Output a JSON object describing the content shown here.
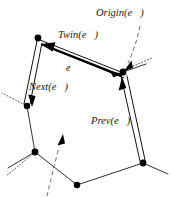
{
  "figure": {
    "background_color": "#ffffff",
    "ink_color": "#000000",
    "width": 172,
    "height": 197
  },
  "labels": {
    "origin": {
      "prefix": "Origin(",
      "symbol": "e",
      "suffix": ")",
      "full": "Origin(e⃗)",
      "x": 96,
      "y": 16
    },
    "twin": {
      "prefix": "Twin(",
      "symbol": "e",
      "suffix": ")",
      "full": "Twin(e⃗)",
      "x": 58,
      "y": 38
    },
    "edge": {
      "prefix": "",
      "symbol": "e",
      "suffix": "",
      "full": "e⃗",
      "x": 66,
      "y": 71
    },
    "next": {
      "prefix": "Next(",
      "symbol": "e",
      "suffix": ")",
      "full": "Next(e⃗)",
      "x": 29,
      "y": 90
    },
    "prev": {
      "prefix": "Prev(",
      "symbol": "e",
      "suffix": ")",
      "full": "Prev(e⃗)",
      "x": 91,
      "y": 124
    }
  },
  "vertices": [
    {
      "name": "top-left",
      "x": 38,
      "y": 38
    },
    {
      "name": "right",
      "x": 123,
      "y": 72
    },
    {
      "name": "left-middle",
      "x": 27,
      "y": 106
    },
    {
      "name": "lower-left",
      "x": 35,
      "y": 152
    },
    {
      "name": "bottom",
      "x": 77,
      "y": 185
    },
    {
      "name": "bottom-right",
      "x": 143,
      "y": 163
    }
  ],
  "edges": {
    "edge_e": {
      "label": "e",
      "style": "bold",
      "from": "right",
      "to": "top-left",
      "arrow": "to"
    },
    "twin_e": {
      "label": "Twin(e)",
      "style": "thin",
      "from": "top-left",
      "to": "right",
      "arrow": "to"
    },
    "next_e": {
      "label": "Next(e)",
      "style": "double-thin",
      "from": "top-left",
      "to": "left-middle",
      "arrow": "to"
    },
    "prev_e": {
      "label": "Prev(e)",
      "style": "double-thin",
      "from": "bottom-right",
      "to": "right",
      "arrow": "to"
    }
  },
  "plain_edges": [
    {
      "from": "left-middle",
      "to": "lower-left"
    },
    {
      "from": "lower-left",
      "to": "bottom"
    },
    {
      "from": "bottom",
      "to": "bottom-right"
    }
  ],
  "dotted_stubs": [
    {
      "name": "stub-upper-right",
      "from_vertex": "right"
    },
    {
      "name": "stub-left",
      "from_vertex": "left-middle"
    },
    {
      "name": "stub-lower-left",
      "from_vertex": "lower-left"
    },
    {
      "name": "stub-bottom-left",
      "from_vertex": "bottom"
    },
    {
      "name": "stub-bottom-right",
      "from_vertex": "bottom-right"
    }
  ],
  "annotations": {
    "origin_pointer": {
      "name": "origin-dashed-pointer",
      "style": "dashed",
      "arrow": "down-left",
      "target_vertex": "right"
    },
    "face_pointer": {
      "name": "face-dashed-pointer",
      "style": "dashed",
      "arrow": "up-right"
    }
  }
}
